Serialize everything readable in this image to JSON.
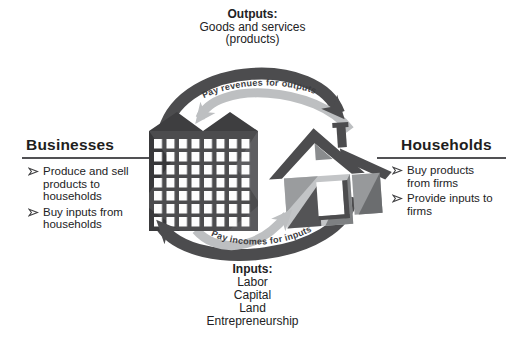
{
  "diagram": {
    "outputs": {
      "heading": "Outputs:",
      "line1": "Goods and services",
      "line2": "(products)"
    },
    "inputs": {
      "heading": "Inputs:",
      "items": [
        "Labor",
        "Capital",
        "Land",
        "Entrepreneurship"
      ]
    },
    "businesses": {
      "heading": "Businesses",
      "bullets": [
        "Produce and sell products to households",
        "Buy inputs from households"
      ]
    },
    "households": {
      "heading": "Households",
      "bullets": [
        "Buy products from firms",
        "Provide inputs to firms"
      ]
    },
    "flows": {
      "top": "Pay revenues for outputs",
      "bottom": "Pay incomes for inputs"
    },
    "icons": {
      "left_center": "office-building-icon",
      "right_center": "house-icon"
    },
    "colors": {
      "dark_gray": "#4c4c4e",
      "light_gray": "#bdbfc1",
      "text": "#222224"
    }
  }
}
